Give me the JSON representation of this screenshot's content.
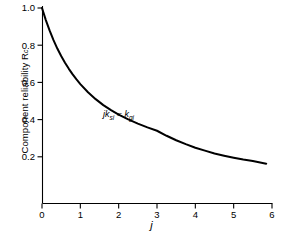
{
  "chart_data": {
    "type": "line",
    "title": "",
    "xlabel": "j",
    "ylabel": "Component reliability R",
    "ylabel_sub": "c",
    "xlim": [
      0,
      6
    ],
    "ylim": [
      0,
      1.0
    ],
    "grid": false,
    "legend": null,
    "xticks": [
      "0",
      "1",
      "2",
      "3",
      "4",
      "5",
      "6"
    ],
    "xtick_values": [
      0,
      1,
      2,
      3,
      4,
      5,
      6
    ],
    "yticks": [
      "0.2",
      "0.4",
      "0.6",
      "0.8",
      "1.0"
    ],
    "ytick_values": [
      0.2,
      0.4,
      0.6,
      0.8,
      1.0
    ],
    "annotations": [
      {
        "text": "jk_si = k_gi",
        "display": "jk",
        "display_sub1": "si",
        "display_mid": " = k",
        "display_sub2": "gi",
        "x": 1.75,
        "y": 0.5
      }
    ],
    "series": [
      {
        "name": "Component reliability",
        "color": "#000000",
        "linewidth": 2.0,
        "x": [
          0.0,
          0.1,
          0.2,
          0.3,
          0.4,
          0.5,
          0.6,
          0.7,
          0.8,
          0.9,
          1.0,
          1.2,
          1.4,
          1.6,
          1.8,
          2.0,
          2.25,
          2.5,
          2.75,
          3.0,
          3.25,
          3.5,
          3.75,
          4.0,
          4.25,
          4.5,
          4.75,
          5.0,
          5.25,
          5.5,
          5.85
        ],
        "y": [
          1.0,
          0.935,
          0.878,
          0.827,
          0.782,
          0.742,
          0.706,
          0.673,
          0.643,
          0.616,
          0.591,
          0.547,
          0.51,
          0.478,
          0.451,
          0.427,
          0.401,
          0.378,
          0.358,
          0.34,
          0.313,
          0.289,
          0.268,
          0.249,
          0.233,
          0.218,
          0.206,
          0.195,
          0.185,
          0.177,
          0.163
        ]
      }
    ]
  },
  "axes": {
    "x_axis_name": "horizontal-axis",
    "y_axis_name": "vertical-axis"
  }
}
